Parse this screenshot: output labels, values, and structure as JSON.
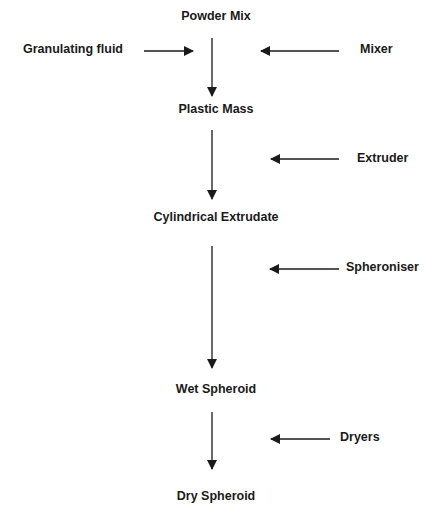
{
  "diagram": {
    "stages": [
      {
        "label": "Powder Mix"
      },
      {
        "label": "Plastic Mass"
      },
      {
        "label": "Cylindrical Extrudate"
      },
      {
        "label": "Wet Spheroid"
      },
      {
        "label": "Dry Spheroid"
      }
    ],
    "inputs": [
      {
        "label": "Granulating fluid",
        "side": "left",
        "into": "Powder Mix → Plastic Mass"
      },
      {
        "label": "Mixer",
        "side": "right",
        "into": "Powder Mix → Plastic Mass"
      },
      {
        "label": "Extruder",
        "side": "right",
        "into": "Plastic Mass → Cylindrical Extrudate"
      },
      {
        "label": "Spheroniser",
        "side": "right",
        "into": "Cylindrical Extrudate → Wet Spheroid"
      },
      {
        "label": "Dryers",
        "side": "right",
        "into": "Wet Spheroid → Dry Spheroid"
      }
    ],
    "colors": {
      "ink": "#1a1a1a",
      "background": "#ffffff"
    }
  }
}
